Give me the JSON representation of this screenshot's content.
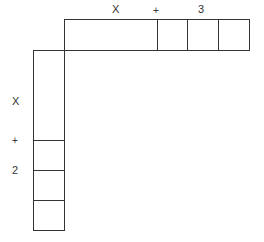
{
  "diagram": {
    "top_factor": {
      "labels": {
        "variable": "X",
        "operator": "+",
        "constant": "3"
      },
      "segments": [
        "x-long",
        "unit",
        "unit",
        "unit"
      ]
    },
    "left_factor": {
      "labels": {
        "variable": "X",
        "operator": "+",
        "constant": "2"
      },
      "segments": [
        "x-long",
        "unit",
        "unit",
        "unit"
      ]
    },
    "colors": {
      "stroke": "#333333",
      "background": "#ffffff"
    }
  }
}
